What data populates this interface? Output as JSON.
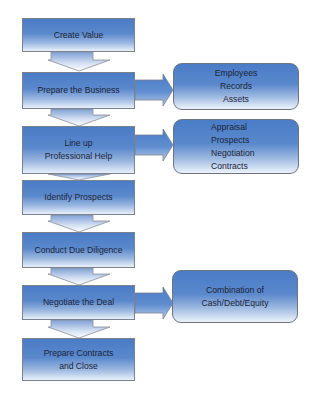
{
  "diagram": {
    "type": "process-flow",
    "colors": {
      "box_top": "#4a7cc6",
      "box_bottom": "#e8f0fa",
      "border": "#7a8290",
      "text": "#1a2438"
    },
    "steps": [
      {
        "label": "Create Value"
      },
      {
        "label": "Prepare the Business"
      },
      {
        "label": "Line up\nProfessional Help"
      },
      {
        "label": "Identify Prospects"
      },
      {
        "label": "Conduct Due Diligence"
      },
      {
        "label": "Negotiate the Deal"
      },
      {
        "label": "Prepare Contracts\nand Close"
      }
    ],
    "details": [
      {
        "from_step": "Prepare the Business",
        "label": "Employees\nRecords\nAssets"
      },
      {
        "from_step": "Line up Professional Help",
        "label": "Appraisal\nProspects\nNegotiation\nContracts"
      },
      {
        "from_step": "Negotiate the Deal",
        "label": "Combination of\nCash/Debt/Equity"
      }
    ]
  }
}
